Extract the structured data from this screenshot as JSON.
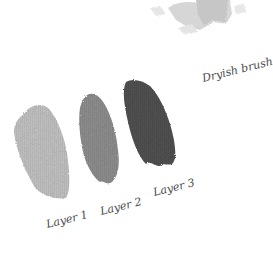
{
  "illustration": {
    "caption": "Dryish brush",
    "layers": [
      {
        "label": "Layer 1",
        "color": "#bdbdbd"
      },
      {
        "label": "Layer 2",
        "color": "#8a8a8a"
      },
      {
        "label": "Layer 3",
        "color": "#4f4f4f"
      }
    ],
    "top_texture_color": "#c8c8c8"
  }
}
